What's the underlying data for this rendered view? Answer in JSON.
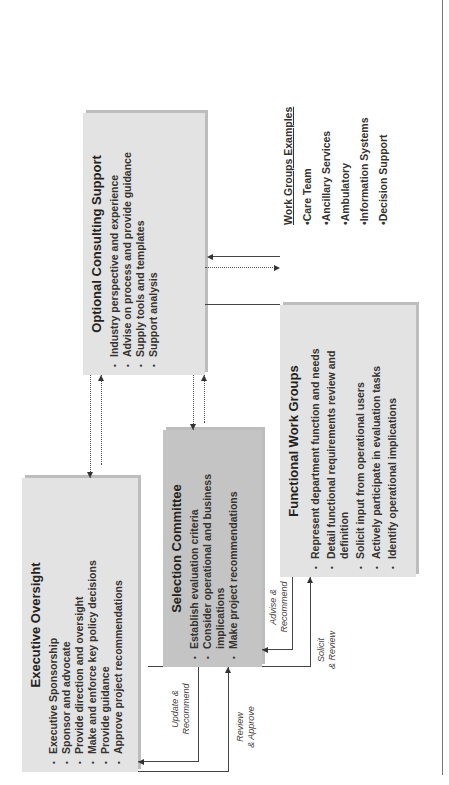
{
  "boxes": {
    "consulting": {
      "title": "Optional Consulting Support",
      "items": [
        "Industry perspective and experience",
        "Advise on process and provide guidance",
        "Supply tools and templates",
        "Support analysis"
      ]
    },
    "executive": {
      "title": "Executive Oversight",
      "items": [
        "Executive Sponsorship",
        "Sponsor and advocate",
        "Provide direction and oversight",
        "Make and enforce key policy decisions",
        "Provide guidance",
        "Approve project recommendations"
      ]
    },
    "selection": {
      "title": "Selection Committee",
      "items": [
        "Establish evaluation criteria",
        "Consider operational and business implications",
        "Make project recommendations"
      ]
    },
    "functional": {
      "title": "Functional Work Groups",
      "items": [
        "Represent department function and needs",
        "Detail functional requirements review and definition",
        "Solicit input from operational users",
        "Actively participate in evaluation tasks",
        "Identify operational implications"
      ]
    }
  },
  "examples": {
    "title": "Work Groups Examples",
    "items": [
      "•Care Team",
      "•Ancillary Services",
      "•Ambulatory",
      "•Information Systems",
      "•Decision Support"
    ]
  },
  "labels": {
    "update_recommend": [
      "Update &",
      "Recommend"
    ],
    "review_approve": [
      "Review",
      "& Approve"
    ],
    "advise_recommend": [
      "Advise &",
      "Recommend"
    ],
    "solicit_review": [
      "Solicit",
      "& Review"
    ]
  }
}
